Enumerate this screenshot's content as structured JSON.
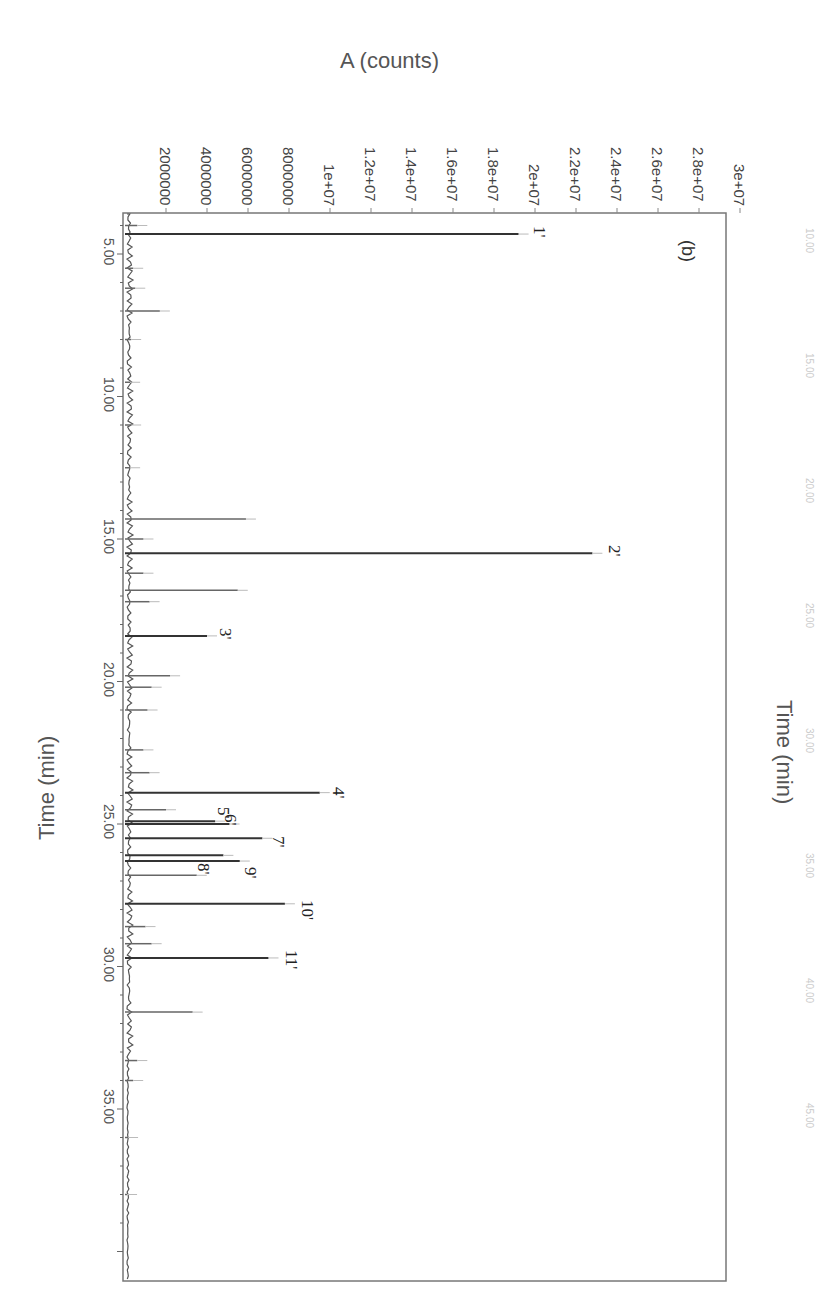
{
  "chart_data": {
    "type": "line",
    "orientation": "rotated-90-clockwise",
    "panel_label": "(b)",
    "title": "",
    "xlabel": "Time (min)",
    "ylabel": "A (counts)",
    "secondary_xlabel_top": "Time (min)",
    "x_ticks": [
      "5.00",
      "10.00",
      "15.00",
      "20.00",
      "25.00",
      "30.00",
      "35.00"
    ],
    "y_ticks": [
      "2000000",
      "4000000",
      "6000000",
      "8000000",
      "1e+07",
      "1.2e+07",
      "1.4e+07",
      "1.6e+07",
      "1.8e+07",
      "2e+07",
      "2.2e+07",
      "2.4e+07",
      "2.6e+07",
      "2.8e+07",
      "3e+07"
    ],
    "xlim": [
      3.7,
      40.3
    ],
    "ylim": [
      0,
      31000000
    ],
    "grid": false,
    "legend": null,
    "labeled_peaks": [
      {
        "label": "1'",
        "time": 4.3,
        "counts": 19200000
      },
      {
        "label": "2'",
        "time": 15.5,
        "counts": 22800000
      },
      {
        "label": "3'",
        "time": 18.4,
        "counts": 4000000
      },
      {
        "label": "4'",
        "time": 23.9,
        "counts": 9500000
      },
      {
        "label": "5'",
        "time": 24.9,
        "counts": 4400000
      },
      {
        "label": "6'",
        "time": 25.0,
        "counts": 5100000
      },
      {
        "label": "7'",
        "time": 25.5,
        "counts": 6700000
      },
      {
        "label": "8'",
        "time": 26.1,
        "counts": 4800000
      },
      {
        "label": "9'",
        "time": 26.3,
        "counts": 5600000
      },
      {
        "label": "10'",
        "time": 27.8,
        "counts": 7800000
      },
      {
        "label": "11'",
        "time": 29.7,
        "counts": 7000000
      }
    ],
    "other_peaks": [
      {
        "time": 4.0,
        "counts": 600000
      },
      {
        "time": 5.5,
        "counts": 400000
      },
      {
        "time": 6.2,
        "counts": 500000
      },
      {
        "time": 7.0,
        "counts": 1700000
      },
      {
        "time": 8.0,
        "counts": 300000
      },
      {
        "time": 9.5,
        "counts": 250000
      },
      {
        "time": 11.0,
        "counts": 300000
      },
      {
        "time": 12.5,
        "counts": 250000
      },
      {
        "time": 14.3,
        "counts": 5900000
      },
      {
        "time": 15.0,
        "counts": 900000
      },
      {
        "time": 16.2,
        "counts": 900000
      },
      {
        "time": 16.8,
        "counts": 5500000
      },
      {
        "time": 17.2,
        "counts": 1200000
      },
      {
        "time": 19.8,
        "counts": 2200000
      },
      {
        "time": 20.2,
        "counts": 1300000
      },
      {
        "time": 21.0,
        "counts": 1100000
      },
      {
        "time": 22.4,
        "counts": 900000
      },
      {
        "time": 23.2,
        "counts": 1200000
      },
      {
        "time": 24.5,
        "counts": 2000000
      },
      {
        "time": 26.8,
        "counts": 3500000
      },
      {
        "time": 28.6,
        "counts": 1000000
      },
      {
        "time": 29.2,
        "counts": 1300000
      },
      {
        "time": 31.6,
        "counts": 3300000
      },
      {
        "time": 33.3,
        "counts": 600000
      },
      {
        "time": 34.0,
        "counts": 400000
      },
      {
        "time": 36.0,
        "counts": 150000
      },
      {
        "time": 38.0,
        "counts": 100000
      }
    ],
    "ghost_top_ticks": [
      "10.00",
      "15.00",
      "20.00",
      "25.00",
      "30.00",
      "35.00",
      "40.00",
      "45.00"
    ]
  },
  "labels": {
    "ylabel": "A (counts)",
    "xlabel": "Time (min)",
    "top_xlabel": "Time (min)",
    "panel": "(b)"
  }
}
